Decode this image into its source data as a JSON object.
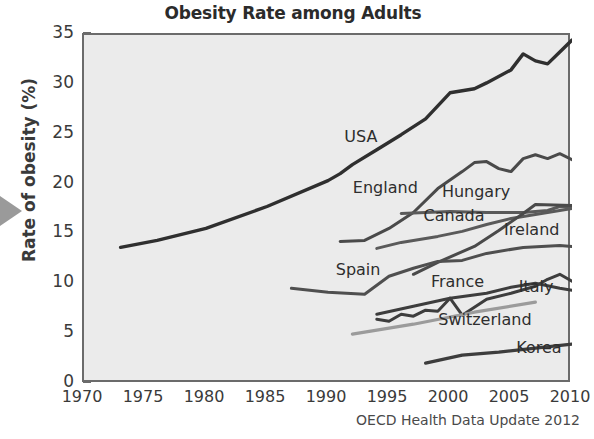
{
  "chart_data": {
    "type": "line",
    "title": "Obesity Rate among Adults",
    "xlabel": "",
    "ylabel": "Rate of obesity (%)",
    "source": "OECD Health Data Update 2012",
    "xlim": [
      1970,
      2010
    ],
    "ylim": [
      0,
      35
    ],
    "grid": false,
    "legend_position": "inline-labels",
    "xticks": [
      1970,
      1975,
      1980,
      1985,
      1990,
      1995,
      2000,
      2005,
      2010
    ],
    "yticks": [
      0,
      5,
      10,
      15,
      20,
      25,
      30,
      35
    ],
    "plot_background": "#ebebeb",
    "series": [
      {
        "name": "USA",
        "color": "#2f2f2f",
        "width": 3.4,
        "label_x": 1991.5,
        "label_y": 24.6,
        "points": [
          [
            1973,
            13.7
          ],
          [
            1976,
            14.4
          ],
          [
            1980,
            15.6
          ],
          [
            1985,
            17.8
          ],
          [
            1990,
            20.4
          ],
          [
            1991,
            21.1
          ],
          [
            1992,
            22.0
          ],
          [
            1994,
            23.5
          ],
          [
            1996,
            25.0
          ],
          [
            1998,
            26.6
          ],
          [
            2000,
            29.2
          ],
          [
            2001,
            29.4
          ],
          [
            2002,
            29.6
          ],
          [
            2003,
            30.2
          ],
          [
            2005,
            31.5
          ],
          [
            2006,
            33.1
          ],
          [
            2007,
            32.4
          ],
          [
            2008,
            32.1
          ],
          [
            2009,
            33.3
          ],
          [
            2010,
            34.5
          ]
        ]
      },
      {
        "name": "England",
        "color": "#4a4a4a",
        "width": 3.0,
        "label_x": 1992.2,
        "label_y": 19.5,
        "points": [
          [
            1991,
            14.3
          ],
          [
            1993,
            14.4
          ],
          [
            1995,
            15.6
          ],
          [
            1997,
            17.2
          ],
          [
            1999,
            19.6
          ],
          [
            2001,
            21.3
          ],
          [
            2002,
            22.2
          ],
          [
            2003,
            22.3
          ],
          [
            2004,
            21.6
          ],
          [
            2005,
            21.3
          ],
          [
            2006,
            22.6
          ],
          [
            2007,
            23.0
          ],
          [
            2008,
            22.6
          ],
          [
            2009,
            23.1
          ],
          [
            2010,
            22.5
          ]
        ]
      },
      {
        "name": "Hungary",
        "color": "#5a5a5a",
        "width": 3.0,
        "label_x": 1999.5,
        "label_y": 19.1,
        "points": [
          [
            1996,
            17.1
          ],
          [
            2000,
            17.3
          ],
          [
            2003,
            17.2
          ],
          [
            2006,
            17.2
          ],
          [
            2008,
            17.4
          ],
          [
            2009,
            17.8
          ],
          [
            2010,
            17.7
          ]
        ]
      },
      {
        "name": "Canada",
        "color": "#5a5a5a",
        "width": 3.0,
        "label_x": 1998.0,
        "label_y": 16.6,
        "points": [
          [
            1994,
            13.6
          ],
          [
            1996,
            14.2
          ],
          [
            1999,
            14.8
          ],
          [
            2001,
            15.3
          ],
          [
            2003,
            16.0
          ],
          [
            2005,
            16.6
          ],
          [
            2007,
            17.0
          ],
          [
            2009,
            17.4
          ],
          [
            2010,
            17.6
          ]
        ]
      },
      {
        "name": "Ireland",
        "color": "#4a4a4a",
        "width": 3.0,
        "label_x": 2004.6,
        "label_y": 15.2,
        "points": [
          [
            1997,
            11.0
          ],
          [
            1999,
            12.2
          ],
          [
            2002,
            13.8
          ],
          [
            2004,
            15.4
          ],
          [
            2006,
            17.1
          ],
          [
            2007,
            18.0
          ],
          [
            2010,
            17.9
          ]
        ]
      },
      {
        "name": "Spain",
        "color": "#4f4f4f",
        "width": 3.0,
        "label_x": 1990.8,
        "label_y": 11.2,
        "points": [
          [
            1987,
            9.6
          ],
          [
            1990,
            9.2
          ],
          [
            1993,
            9.0
          ],
          [
            1995,
            10.8
          ],
          [
            1997,
            11.6
          ],
          [
            1999,
            12.3
          ],
          [
            2001,
            12.4
          ],
          [
            2003,
            13.1
          ],
          [
            2006,
            13.7
          ],
          [
            2009,
            13.9
          ],
          [
            2010,
            13.8
          ]
        ]
      },
      {
        "name": "France",
        "color": "#3d3d3d",
        "width": 3.0,
        "label_x": 1998.6,
        "label_y": 10.0,
        "points": [
          [
            1994,
            6.5
          ],
          [
            1995,
            6.3
          ],
          [
            1996,
            7.0
          ],
          [
            1997,
            6.8
          ],
          [
            1998,
            7.4
          ],
          [
            1999,
            7.3
          ],
          [
            2000,
            8.6
          ],
          [
            2001,
            6.9
          ],
          [
            2002,
            7.7
          ],
          [
            2003,
            8.5
          ],
          [
            2005,
            9.1
          ],
          [
            2007,
            9.8
          ],
          [
            2008,
            10.5
          ],
          [
            2009,
            11.0
          ],
          [
            2010,
            10.3
          ]
        ]
      },
      {
        "name": "Italy",
        "color": "#3d3d3d",
        "width": 3.0,
        "label_x": 2005.8,
        "label_y": 9.5,
        "points": [
          [
            1994,
            7.0
          ],
          [
            1997,
            7.8
          ],
          [
            2000,
            8.6
          ],
          [
            2003,
            9.1
          ],
          [
            2005,
            9.7
          ],
          [
            2007,
            10.1
          ],
          [
            2009,
            9.6
          ],
          [
            2010,
            9.4
          ]
        ]
      },
      {
        "name": "Switzerland",
        "color": "#9b9b9b",
        "width": 3.2,
        "label_x": 1999.2,
        "label_y": 6.2,
        "points": [
          [
            1992,
            5.0
          ],
          [
            1997,
            6.0
          ],
          [
            2002,
            7.2
          ],
          [
            2007,
            8.2
          ]
        ]
      },
      {
        "name": "Korea",
        "color": "#3d3d3d",
        "width": 3.2,
        "label_x": 2005.6,
        "label_y": 3.4,
        "points": [
          [
            1998,
            2.1
          ],
          [
            2001,
            2.9
          ],
          [
            2004,
            3.2
          ],
          [
            2007,
            3.6
          ],
          [
            2010,
            4.0
          ]
        ]
      }
    ]
  },
  "axis": {
    "ylabel": "Rate of obesity (%)",
    "ytick_labels": [
      "35",
      "30",
      "25",
      "20",
      "15",
      "10",
      "5",
      "0"
    ],
    "xtick_labels": [
      "1970",
      "1975",
      "1980",
      "1985",
      "1990",
      "1995",
      "2000",
      "2005",
      "2010"
    ]
  },
  "icons": {
    "left_pointer": "triangle-right-pointer-icon"
  }
}
